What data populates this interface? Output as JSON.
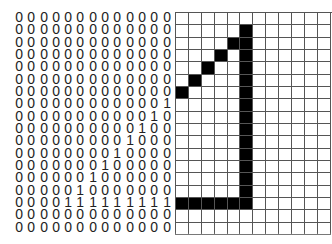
{
  "binary_matrix": {
    "rows": 18,
    "cols": 13,
    "values": [
      "0000000000000",
      "0000000000000",
      "0000000000000",
      "0000000000000",
      "0000000000000",
      "0000000000000",
      "0000000000000",
      "0000000000001",
      "0000000000010",
      "0000000000100",
      "0000000001000",
      "0000000010000",
      "0000000100000",
      "0000001000000",
      "0000010000000",
      "0000111111111",
      "0000000000000",
      "0000000000000"
    ]
  },
  "pixel_grid": {
    "rows": 18,
    "cols": 12,
    "filled_color": "#000000",
    "empty_color": "#ffffff",
    "line_color": "#555555",
    "filled_cells": [
      [
        1,
        5
      ],
      [
        2,
        4
      ],
      [
        2,
        5
      ],
      [
        3,
        3
      ],
      [
        3,
        5
      ],
      [
        4,
        2
      ],
      [
        4,
        5
      ],
      [
        5,
        1
      ],
      [
        5,
        5
      ],
      [
        6,
        0
      ],
      [
        6,
        5
      ],
      [
        7,
        5
      ],
      [
        8,
        5
      ],
      [
        9,
        5
      ],
      [
        10,
        5
      ],
      [
        11,
        5
      ],
      [
        12,
        5
      ],
      [
        13,
        5
      ],
      [
        14,
        5
      ],
      [
        15,
        0
      ],
      [
        15,
        1
      ],
      [
        15,
        2
      ],
      [
        15,
        3
      ],
      [
        15,
        4
      ],
      [
        15,
        5
      ]
    ]
  }
}
